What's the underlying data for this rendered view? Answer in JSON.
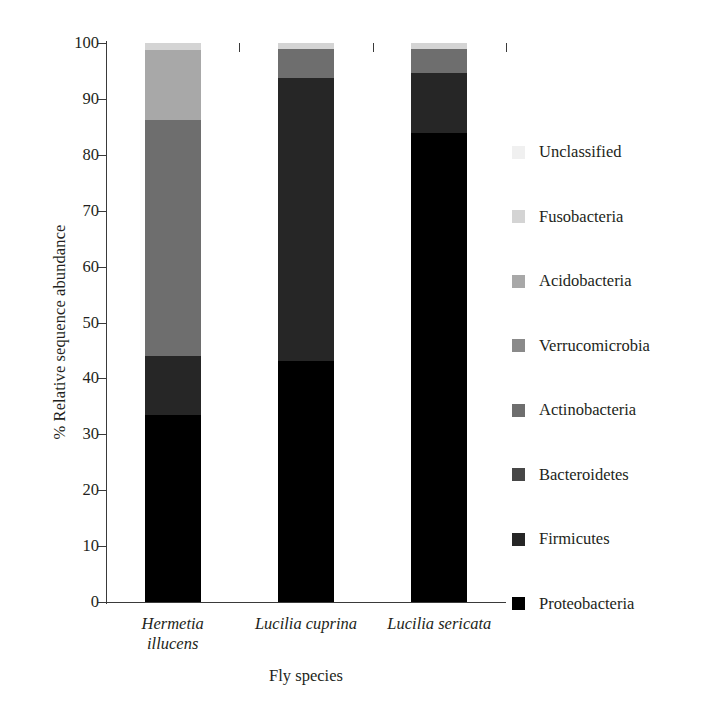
{
  "chart_data": {
    "type": "bar",
    "subtype": "stacked-bar-100-percent",
    "title": "",
    "xlabel": "Fly species",
    "ylabel": "% Relative sequence abundance",
    "categories": [
      "Hermetia illucens",
      "Lucilia cuprina",
      "Lucilia sericata"
    ],
    "category_lines": [
      [
        "Hermetia",
        "illucens"
      ],
      [
        "Lucilia cuprina"
      ],
      [
        "Lucilia sericata"
      ]
    ],
    "ylim": [
      0,
      100
    ],
    "yticks": [
      0,
      10,
      20,
      30,
      40,
      50,
      60,
      70,
      80,
      90,
      100
    ],
    "ytick_labels": [
      "0",
      "10",
      "20",
      "30",
      "40",
      "50",
      "60",
      "70",
      "80",
      "90",
      "100"
    ],
    "grid": false,
    "legend_position": "right",
    "stack_order_bottom_to_top": [
      "Proteobacteria",
      "Firmicutes",
      "Bacteroidetes",
      "Actinobacteria",
      "Verrucomicrobia",
      "Acidobacteria",
      "Fusobacteria",
      "Unclassified"
    ],
    "series": [
      {
        "name": "Proteobacteria",
        "color": "#000000",
        "values": [
          33.5,
          43.1,
          83.9
        ]
      },
      {
        "name": "Firmicutes",
        "color": "#262626",
        "values": [
          10.5,
          50.6,
          10.7
        ]
      },
      {
        "name": "Bacteroidetes",
        "color": "#474747",
        "values": [
          0.0,
          0.0,
          0.0
        ]
      },
      {
        "name": "Actinobacteria",
        "color": "#6e6e6e",
        "values": [
          42.2,
          5.3,
          4.4
        ]
      },
      {
        "name": "Verrucomicrobia",
        "color": "#8a8a8a",
        "values": [
          0.0,
          0.0,
          0.0
        ]
      },
      {
        "name": "Acidobacteria",
        "color": "#a8a8a8",
        "values": [
          12.5,
          0.0,
          0.0
        ]
      },
      {
        "name": "Fusobacteria",
        "color": "#d4d4d4",
        "values": [
          1.3,
          1.0,
          1.0
        ]
      },
      {
        "name": "Unclassified",
        "color": "#f0f0f0",
        "values": [
          0.0,
          0.0,
          0.0
        ]
      }
    ]
  },
  "axis": {
    "y_title": "% Relative sequence abundance",
    "x_title": "Fly species"
  },
  "legend": {
    "entries": [
      {
        "label": "Unclassified",
        "color": "#f0f0f0"
      },
      {
        "label": "Fusobacteria",
        "color": "#d4d4d4"
      },
      {
        "label": "Acidobacteria",
        "color": "#a8a8a8"
      },
      {
        "label": "Verrucomicrobia",
        "color": "#8a8a8a"
      },
      {
        "label": "Actinobacteria",
        "color": "#6e6e6e"
      },
      {
        "label": "Bacteroidetes",
        "color": "#474747"
      },
      {
        "label": "Firmicutes",
        "color": "#262626"
      },
      {
        "label": "Proteobacteria",
        "color": "#000000"
      }
    ]
  }
}
